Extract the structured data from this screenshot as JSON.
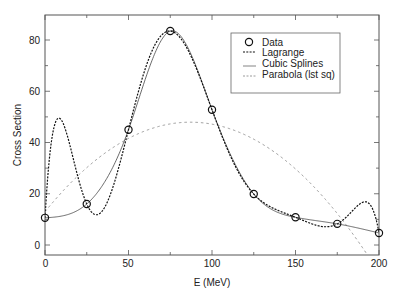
{
  "chart_data": {
    "type": "line",
    "title": "",
    "xlabel": "E (MeV)",
    "ylabel": "Cross Section",
    "xlim": [
      0,
      200
    ],
    "ylim": [
      -4,
      90
    ],
    "xticks": [
      0,
      50,
      100,
      150,
      200
    ],
    "yticks": [
      0,
      20,
      40,
      60,
      80
    ],
    "grid": false,
    "legend_position": "upper right",
    "x": [
      0,
      25,
      50,
      75,
      100,
      125,
      150,
      175,
      200
    ],
    "series": [
      {
        "name": "Data",
        "style": "open-circle",
        "values": [
          10.6,
          16.0,
          45.0,
          83.5,
          52.8,
          19.9,
          10.8,
          8.25,
          4.7
        ]
      },
      {
        "name": "Lagrange",
        "style": "dashed-black",
        "method": "lagrange"
      },
      {
        "name": "Cubic Splines",
        "style": "solid-thin",
        "method": "natural-cubic-spline"
      },
      {
        "name": "Parabola (lst sq)",
        "style": "dashed-gray",
        "method": "least-squares-quadratic"
      }
    ],
    "annotations": []
  },
  "colors": {
    "frame": "#555555",
    "data": "#111111",
    "lagrange": "#111111",
    "spline": "#444444",
    "parabola": "#9a9a9a"
  },
  "legend": {
    "items": [
      "Data",
      "Lagrange",
      "Cubic Splines",
      "Parabola (lst sq)"
    ]
  },
  "axes": {
    "x_tick_labels": [
      "0",
      "50",
      "100",
      "150",
      "200"
    ],
    "y_tick_labels": [
      "0",
      "20",
      "40",
      "60",
      "80"
    ],
    "x_title": "E (MeV)",
    "y_title": "Cross Section"
  }
}
